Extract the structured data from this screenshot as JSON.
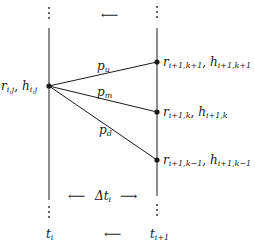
{
  "diagram": {
    "type": "trinomial-tree-step",
    "left_time": {
      "base": "t",
      "sub": "i"
    },
    "right_time": {
      "base": "t",
      "sub": "i+1"
    },
    "interval": {
      "base": "Δt",
      "sub": "i"
    },
    "top_arrow": "⟵",
    "bottom_arrow": "⟵",
    "interval_left_arrow": "⟵",
    "interval_right_arrow": "⟶",
    "source_node": {
      "label": [
        {
          "base": "r",
          "sub": "i,j"
        },
        {
          "sep": ", "
        },
        {
          "base": "h",
          "sub": "i,j"
        }
      ]
    },
    "target_nodes": [
      {
        "id": "up",
        "label": [
          {
            "base": "r",
            "sub": "i+1,k+1"
          },
          {
            "sep": ", "
          },
          {
            "base": "h",
            "sub": "i+1,k+1"
          }
        ]
      },
      {
        "id": "mid",
        "label": [
          {
            "base": "r",
            "sub": "i+1,k"
          },
          {
            "sep": ", "
          },
          {
            "base": "h",
            "sub": "i+1,k"
          }
        ]
      },
      {
        "id": "down",
        "label": [
          {
            "base": "r",
            "sub": "i+1,k−1"
          },
          {
            "sep": ", "
          },
          {
            "base": "h",
            "sub": "i+1,k−1"
          }
        ]
      }
    ],
    "edges": [
      {
        "to": "up",
        "prob": {
          "base": "p",
          "sub": "u"
        }
      },
      {
        "to": "mid",
        "prob": {
          "base": "p",
          "sub": "m"
        }
      },
      {
        "to": "down",
        "prob": {
          "base": "p",
          "sub": "d"
        }
      }
    ],
    "colors": {
      "ink": "#1a1a1a",
      "background": "#ffffff"
    }
  }
}
